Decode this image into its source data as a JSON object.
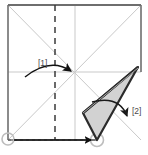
{
  "figure": {
    "kind": "origami-fold-diagram",
    "canvas": {
      "width": 148,
      "height": 155,
      "background": "#ffffff"
    },
    "colors": {
      "paper_edge": "#6e6e6e",
      "crease_light": "#c9c9c9",
      "crease_dashed": "#3a3a3a",
      "flap_fill": "#d2d2d2",
      "flap_edge": "#2b2b2b",
      "arrow": "#1a1a1a",
      "marker_circle": "#bdbdbd",
      "label_text": "#4a4a4a"
    },
    "paper": {
      "shape": "square",
      "top_left": [
        8,
        5
      ],
      "top_right": [
        141,
        5
      ],
      "bottom_right": [
        141,
        140
      ],
      "bottom_left": [
        8,
        140
      ]
    },
    "creases": [
      {
        "name": "diagonal-tl-br",
        "style": "solid-light",
        "from": [
          8,
          5
        ],
        "to": [
          141,
          140
        ]
      },
      {
        "name": "diagonal-bl-tr",
        "style": "solid-light",
        "from": [
          8,
          140
        ],
        "to": [
          141,
          5
        ]
      },
      {
        "name": "vertical-center",
        "style": "solid-light",
        "from": [
          75,
          5
        ],
        "to": [
          75,
          140
        ]
      },
      {
        "name": "horizontal-center",
        "style": "solid-light",
        "from": [
          8,
          72
        ],
        "to": [
          141,
          72
        ]
      },
      {
        "name": "vertical-quarter-left",
        "style": "dashed",
        "from": [
          55,
          5
        ],
        "to": [
          55,
          140
        ]
      }
    ],
    "flap": {
      "name": "folded-flap",
      "fill": "#d2d2d2",
      "points": [
        [
          138,
          67
        ],
        [
          83,
          113
        ],
        [
          97,
          140
        ]
      ],
      "description": "Shaded triangular flap swung out to the right"
    },
    "markers": [
      {
        "name": "corner-marker-bottom-left",
        "cx": 8,
        "cy": 139,
        "r": 6
      },
      {
        "name": "corner-marker-bottom-flap",
        "cx": 97,
        "cy": 140,
        "r": 6
      }
    ],
    "guide_line": {
      "name": "baseline-dashed-guide",
      "from": [
        8,
        140
      ],
      "to": [
        97,
        140
      ],
      "style": "dashed"
    },
    "labels": [
      {
        "id": "l1",
        "text": "[1]",
        "x": 38,
        "y": 66
      },
      {
        "id": "l2",
        "text": "[2]",
        "x": 132,
        "y": 114
      }
    ],
    "arrows": [
      {
        "name": "arrow-fold-to-center",
        "label_ref": "[1]",
        "path": "M 25,76 Q 50,58 72,72",
        "tip": [
          75,
          74
        ],
        "direction": "right",
        "meaning": "fold left-bottom corner inward to center point"
      },
      {
        "name": "arrow-swing-flap",
        "label_ref": "[2]",
        "path": "M 92,102 Q 118,96 128,118",
        "tip": [
          131,
          131
        ],
        "direction": "down",
        "meaning": "swing flap downward/outward"
      },
      {
        "name": "arrow-slide-along-base",
        "path": "M 14,140 L 93,140",
        "tip": [
          97,
          141
        ],
        "direction": "right",
        "meaning": "bottom corner travels right along the base edge"
      }
    ]
  }
}
